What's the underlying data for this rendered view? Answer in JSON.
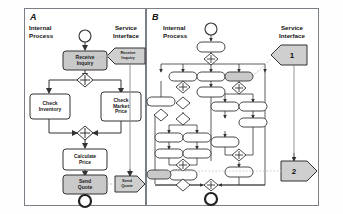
{
  "figure": {
    "panels": [
      {
        "id": "A",
        "label": "A",
        "columns": [
          {
            "name": "internal-process",
            "label": "Internal\nProcess"
          },
          {
            "name": "service-interface",
            "label": "Service\nInterface"
          }
        ],
        "nodes": [
          {
            "name": "start-node",
            "type": "initial",
            "label": ""
          },
          {
            "name": "activity-receive-inquiry",
            "type": "activity",
            "label": "Receive\nInquiry",
            "fill": "#c9c9c9"
          },
          {
            "name": "fork-node",
            "type": "fork",
            "label": "+"
          },
          {
            "name": "activity-check-inventory",
            "type": "activity",
            "label": "Check\nInventory",
            "fill": "#ffffff"
          },
          {
            "name": "activity-check-market-price",
            "type": "activity",
            "label": "Check\nMarket\nPrice",
            "fill": "#ffffff"
          },
          {
            "name": "join-node",
            "type": "join",
            "label": "+"
          },
          {
            "name": "activity-calculate-price",
            "type": "activity",
            "label": "Calculate\nPrice",
            "fill": "#ffffff"
          },
          {
            "name": "activity-send-quote",
            "type": "activity",
            "label": "Send\nQuote",
            "fill": "#c9c9c9"
          },
          {
            "name": "end-node",
            "type": "final",
            "label": ""
          },
          {
            "name": "interface-receive-inquiry",
            "type": "interface-in",
            "label": "Receive\nInquiry",
            "fill": "#cfcfcf"
          },
          {
            "name": "interface-send-quote",
            "type": "interface-out",
            "label": "Send\nQuote",
            "fill": "#cfcfcf"
          }
        ]
      },
      {
        "id": "B",
        "label": "B",
        "columns": [
          {
            "name": "internal-process",
            "label": "Internal\nProcess"
          },
          {
            "name": "service-interface",
            "label": "Service\nInterface"
          }
        ],
        "nodes": [
          {
            "name": "start-node",
            "type": "initial",
            "label": ""
          },
          {
            "name": "end-node",
            "type": "final",
            "label": ""
          },
          {
            "name": "interface-marker-1",
            "type": "interface-in",
            "label": "1",
            "fill": "#cfcfcf"
          },
          {
            "name": "interface-marker-2",
            "type": "interface-out",
            "label": "2",
            "fill": "#cfcfcf"
          }
        ]
      }
    ],
    "colors": {
      "frame": "#7a7f85",
      "stroke": "#333333",
      "activity_fill": "#ffffff",
      "highlight_fill": "#c9c9c9",
      "interface_fill": "#cfcfcf",
      "dotted_link": "#b9b9b9"
    }
  }
}
